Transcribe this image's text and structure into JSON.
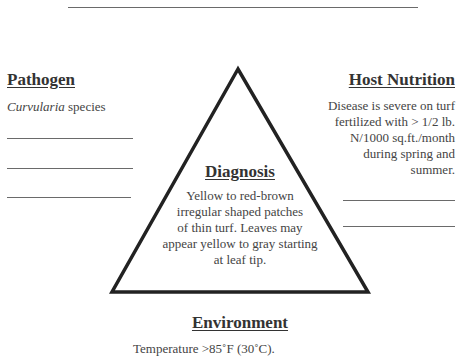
{
  "pathogen": {
    "heading": "Pathogen",
    "genus": "Curvularia",
    "rest": " species"
  },
  "host_nutrition": {
    "heading": "Host Nutrition",
    "lines": [
      "Disease is severe on turf",
      "fertilized with > 1/2 lb.",
      "N/1000 sq.ft./month",
      "during spring and",
      "summer."
    ]
  },
  "diagnosis": {
    "heading": "Diagnosis",
    "lines": [
      "Yellow to red-brown",
      "irregular shaped patches",
      "of thin turf.  Leaves may",
      "appear yellow to gray starting",
      "at leaf tip."
    ]
  },
  "environment": {
    "heading": "Environment",
    "text": "Temperature >85˚F (30˚C)."
  }
}
